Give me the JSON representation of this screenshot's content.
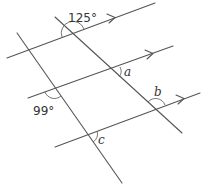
{
  "diagram": {
    "labels": {
      "angle_top": "125°",
      "angle_left": "99°",
      "angle_a": "a",
      "angle_b": "b",
      "angle_c": "c"
    },
    "colors": {
      "line": "#555555",
      "text": "#333333"
    },
    "parallel_lines": [
      {
        "id": "L1",
        "from": [
          7,
          58
        ],
        "to": [
          155,
          3
        ],
        "arrow_at": [
          114,
          18
        ]
      },
      {
        "id": "L2",
        "from": [
          28,
          98
        ],
        "to": [
          173,
          46
        ],
        "arrow_at": [
          152,
          54
        ]
      },
      {
        "id": "L3",
        "from": [
          55,
          147
        ],
        "to": [
          200,
          93
        ],
        "arrow_at": [
          183,
          99
        ]
      }
    ],
    "transversals": [
      {
        "id": "T1",
        "from": [
          17,
          33
        ],
        "to": [
          122,
          183
        ]
      },
      {
        "id": "T2",
        "from": [
          55,
          17
        ],
        "to": [
          182,
          133
        ]
      }
    ]
  }
}
